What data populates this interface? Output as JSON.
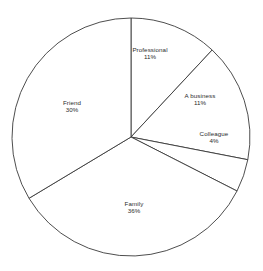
{
  "chart_data": {
    "type": "pie",
    "title": "",
    "subtitle": "",
    "xlabel": "",
    "ylabel": "",
    "legend": "none",
    "grid": false,
    "start_angle_deg": 0,
    "direction": "clockwise",
    "center": {
      "x": 131,
      "y": 137
    },
    "radius": 119,
    "value_unit": "%",
    "categories": [
      "Professional",
      "A business",
      "Colleague",
      "Family",
      "Friend"
    ],
    "values": [
      11,
      11,
      4,
      36,
      30
    ],
    "slices": [
      {
        "name": "Professional",
        "value": 11,
        "value_label": "11%",
        "start_deg": 0,
        "end_deg": 43,
        "fill": "#ffffff",
        "stroke": "#3a3a3a",
        "label_x": 150,
        "label_y": 53
      },
      {
        "name": "A business",
        "value": 11,
        "value_label": "11%",
        "start_deg": 43,
        "end_deg": 101,
        "fill": "#ffffff",
        "stroke": "#3a3a3a",
        "label_x": 200,
        "label_y": 99
      },
      {
        "name": "Colleague",
        "value": 4,
        "value_label": "4%",
        "start_deg": 101,
        "end_deg": 117,
        "fill": "#ffffff",
        "stroke": "#3a3a3a",
        "label_x": 214,
        "label_y": 137
      },
      {
        "name": "Family",
        "value": 36,
        "value_label": "36%",
        "start_deg": 117,
        "end_deg": 239,
        "fill": "#ffffff",
        "stroke": "#3a3a3a",
        "label_x": 134,
        "label_y": 207
      },
      {
        "name": "Friend",
        "value": 30,
        "value_label": "30%",
        "start_deg": 239,
        "end_deg": 360,
        "fill": "#ffffff",
        "stroke": "#3a3a3a",
        "label_x": 72,
        "label_y": 106
      }
    ]
  },
  "canvas": {
    "width": 263,
    "height": 271,
    "background": "#ffffff",
    "outline_color": "#3a3a3a",
    "text_color": "#2b2b2b"
  }
}
